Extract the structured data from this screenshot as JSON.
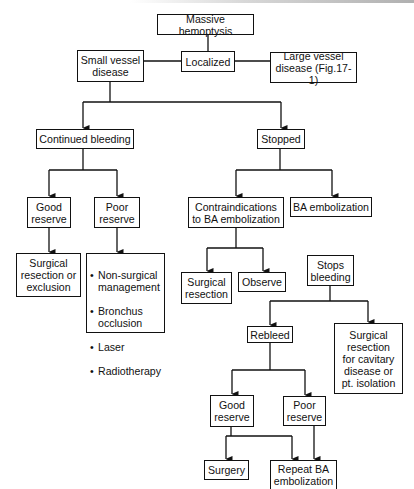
{
  "diagram": {
    "type": "flowchart",
    "title": "Massive hemoptysis",
    "nodes": {
      "massive_hemoptysis": "Massive hemoptysis",
      "localized": "Localized",
      "small_vessel": "Small vessel\ndisease",
      "large_vessel": "Large vessel\ndisease (Fig.17-1)",
      "continued_bleeding": "Continued bleeding",
      "stopped": "Stopped",
      "good_reserve_1": "Good\nreserve",
      "poor_reserve_1": "Poor\nreserve",
      "surgical_resection_exclusion": "Surgical\nresection or\nexclusion",
      "poor_reserve_options": [
        "Non-surgical\nmanagement",
        "Bronchus\nocclusion",
        "Laser",
        "Radiotherapy"
      ],
      "contraindications": "Contraindications\nto BA embolization",
      "ba_embolization": "BA embolization",
      "surgical_resection": "Surgical\nresection",
      "observe": "Observe",
      "stops_bleeding": "Stops\nbleeding",
      "rebleed": "Rebleed",
      "surgical_resection_cavitary": "Surgical\nresection\nfor cavitary\ndisease or\npt. isolation",
      "good_reserve_2": "Good\nreserve",
      "poor_reserve_2": "Poor\nreserve",
      "surgery": "Surgery",
      "repeat_ba_embolization": "Repeat BA\nembolization"
    },
    "edges": [
      [
        "massive_hemoptysis",
        "localized"
      ],
      [
        "localized",
        "small_vessel"
      ],
      [
        "localized",
        "large_vessel"
      ],
      [
        "small_vessel",
        "continued_bleeding"
      ],
      [
        "small_vessel",
        "stopped"
      ],
      [
        "continued_bleeding",
        "good_reserve_1"
      ],
      [
        "continued_bleeding",
        "poor_reserve_1"
      ],
      [
        "good_reserve_1",
        "surgical_resection_exclusion"
      ],
      [
        "poor_reserve_1",
        "poor_reserve_options"
      ],
      [
        "stopped",
        "contraindications"
      ],
      [
        "stopped",
        "ba_embolization"
      ],
      [
        "contraindications",
        "surgical_resection"
      ],
      [
        "contraindications",
        "observe"
      ],
      [
        "stops_bleeding",
        "rebleed"
      ],
      [
        "stops_bleeding",
        "surgical_resection_cavitary"
      ],
      [
        "rebleed",
        "good_reserve_2"
      ],
      [
        "rebleed",
        "poor_reserve_2"
      ],
      [
        "good_reserve_2",
        "surgery"
      ],
      [
        "good_reserve_2",
        "repeat_ba_embolization"
      ],
      [
        "poor_reserve_2",
        "repeat_ba_embolization"
      ]
    ],
    "colors": {
      "line": "#111111",
      "box_border": "#111111",
      "background": "#ffffff"
    }
  }
}
